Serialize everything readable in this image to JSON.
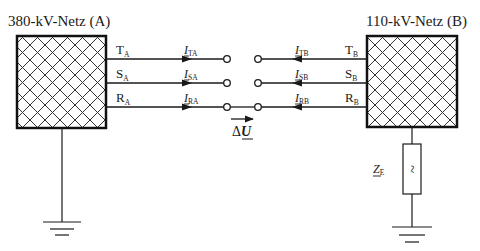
{
  "diagram": {
    "network_a": {
      "title": "380-kV-Netz (A)",
      "phases": [
        {
          "letter": "T",
          "sub": "A"
        },
        {
          "letter": "S",
          "sub": "A"
        },
        {
          "letter": "R",
          "sub": "A"
        }
      ],
      "currents": [
        {
          "letter": "I",
          "sub": "TA"
        },
        {
          "letter": "I",
          "sub": "SA"
        },
        {
          "letter": "I",
          "sub": "RA"
        }
      ],
      "grounding": "direct"
    },
    "network_b": {
      "title": "110-kV-Netz (B)",
      "phases": [
        {
          "letter": "T",
          "sub": "B"
        },
        {
          "letter": "S",
          "sub": "B"
        },
        {
          "letter": "R",
          "sub": "B"
        }
      ],
      "currents": [
        {
          "letter": "I",
          "sub": "TB"
        },
        {
          "letter": "I",
          "sub": "SB"
        },
        {
          "letter": "I",
          "sub": "RB"
        }
      ],
      "grounding": "impedance"
    },
    "switch_states": [
      "open",
      "open",
      "closed"
    ],
    "voltage_label": {
      "delta": "Δ",
      "letter": "U"
    },
    "impedance_label": {
      "letter": "Z",
      "sub": "E"
    },
    "impedance_symbol": "~",
    "colors": {
      "line": "#1a1a1a",
      "hatch": "#333333",
      "background": "#ffffff"
    }
  }
}
